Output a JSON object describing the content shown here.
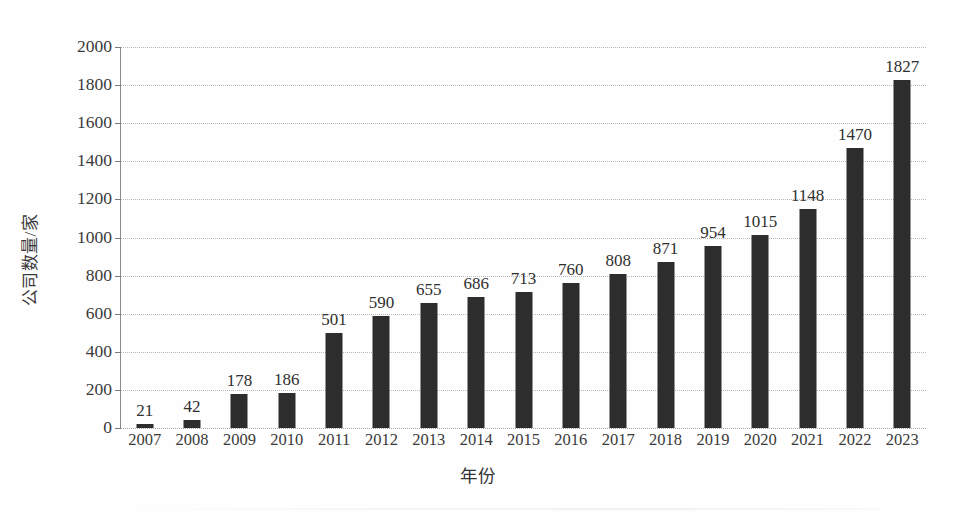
{
  "chart_data": {
    "type": "bar",
    "title": "",
    "xlabel": "年份",
    "ylabel": "公司数量/家",
    "categories": [
      "2007",
      "2008",
      "2009",
      "2010",
      "2011",
      "2012",
      "2013",
      "2014",
      "2015",
      "2016",
      "2017",
      "2018",
      "2019",
      "2020",
      "2021",
      "2022",
      "2023"
    ],
    "values": [
      21,
      42,
      178,
      186,
      501,
      590,
      655,
      686,
      713,
      760,
      808,
      871,
      954,
      1015,
      1148,
      1470,
      1827
    ],
    "value_labels": [
      "21",
      "42",
      "178",
      "186",
      "501",
      "590",
      "655",
      "686",
      "713",
      "760",
      "808",
      "871",
      "954",
      "1015",
      "1148",
      "1470",
      "1827"
    ],
    "ylim": [
      0,
      2000
    ],
    "y_ticks": [
      0,
      200,
      400,
      600,
      800,
      1000,
      1200,
      1400,
      1600,
      1800,
      2000
    ],
    "y_tick_labels": [
      "0",
      "200",
      "400",
      "600",
      "800",
      "1000",
      "1200",
      "1400",
      "1600",
      "1800",
      "2000"
    ],
    "grid": true,
    "grid_axis": "y",
    "grid_style": "dotted",
    "legend": false,
    "bar_color": "#2d2d2d",
    "grid_color": "#b9b9b9",
    "axis_color": "#8a8a8a",
    "background_color": "#fefefe"
  }
}
